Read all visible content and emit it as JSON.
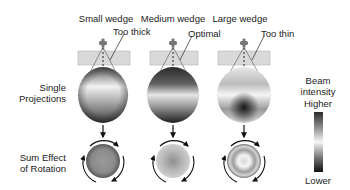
{
  "columns": [
    {
      "title": "Small wedge",
      "annotation": "Too thick"
    },
    {
      "title": "Medium wedge",
      "annotation": "Optimal"
    },
    {
      "title": "Large wedge",
      "annotation": "Too thin"
    }
  ],
  "rows": {
    "projections_line1": "Single",
    "projections_line2": "Projections",
    "sum_line1": "Sum Effect",
    "sum_line2": "of Rotation"
  },
  "legend": {
    "title_line1": "Beam",
    "title_line2": "intensity",
    "high": "Higher",
    "low": "Lower"
  }
}
